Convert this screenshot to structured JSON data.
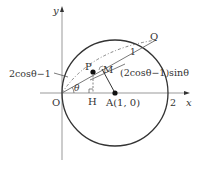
{
  "diagram": {
    "axes": {
      "x_label": "x",
      "y_label": "y",
      "origin_label": "O",
      "x_tick": "2"
    },
    "points": {
      "P": "P",
      "Q": "Q",
      "M": "M",
      "H": "H",
      "A": "A(1, 0)"
    },
    "annotations": {
      "left": "2cosθ−1",
      "right": "(2cosθ−1)sinθ",
      "radius": "1",
      "angle": "θ"
    },
    "colors": {
      "stroke": "#333333",
      "axis": "#888888"
    }
  }
}
